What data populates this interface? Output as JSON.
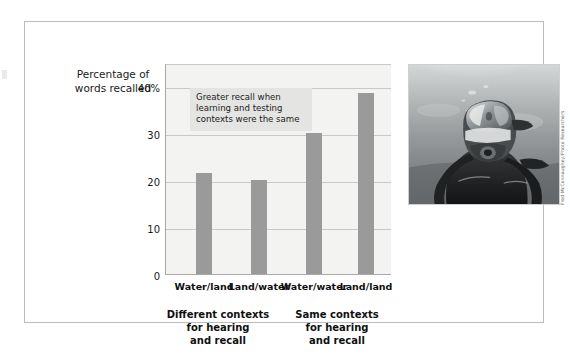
{
  "figure": {
    "axis_title": "Percentage of\nwords recalled",
    "annotation": "Greater recall when learning and testing contexts were the same",
    "group_captions": [
      "Different contexts\nfor hearing\nand recall",
      "Same contexts\nfor hearing\nand recall"
    ]
  },
  "photo": {
    "alt": "black-and-white underwater photograph of a scuba diver wearing a mask and regulator",
    "credit": "Fred McConnaughey/Photo Researchers"
  },
  "colors": {
    "bar": "#9a9a9a",
    "plot_background": "#f3f3f1",
    "gridline": "#c9c9c7",
    "axis": "#a8a8a8",
    "annotation_background": "#e4e4e2",
    "frame_border": "#b9bcc0"
  },
  "chart_data": {
    "type": "bar",
    "title": "",
    "xlabel": "",
    "ylabel": "Percentage of words recalled",
    "categories": [
      "Water/land",
      "Land/water",
      "Water/water",
      "Land/land"
    ],
    "values": [
      21.5,
      20,
      30,
      38.5
    ],
    "ylim": [
      0,
      45
    ],
    "yticks": [
      0,
      10,
      20,
      30,
      40
    ],
    "ytick_labels": [
      "0",
      "10",
      "20",
      "30",
      "40%"
    ],
    "grid": true,
    "legend": "none",
    "group_labels": [
      "Different contexts for hearing and recall",
      "Same contexts for hearing and recall"
    ],
    "annotations": [
      "Greater recall when learning and testing contexts were the same"
    ]
  }
}
